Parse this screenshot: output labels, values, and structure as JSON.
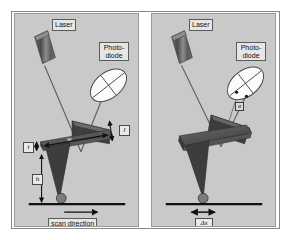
{
  "figure": {
    "caption_absent": true,
    "panels": [
      {
        "id": "left",
        "name": "undeflected-cantilever",
        "labels": {
          "laser": "Laser",
          "photodiode_line1": "Photo-",
          "photodiode_line2": "diode",
          "thickness": "t",
          "width": "w",
          "length": "l",
          "height": "h",
          "scan_direction": "scan direction"
        }
      },
      {
        "id": "right",
        "name": "deflected-cantilever",
        "labels": {
          "laser": "Laser",
          "photodiode_line1": "Photo-",
          "photodiode_line2": "diode",
          "beam_shift_angle": "α",
          "lateral_displacement": "Δs"
        }
      }
    ],
    "colors": {
      "panel_background": "#c9c9c9",
      "frame_border": "#8a8a8a",
      "cantilever_top": "#7a7a7a",
      "cantilever_dark": "#4a4a4a",
      "tip_dark": "#3f3f3f",
      "laser_body": "#5e5e5e",
      "photodiode_face": "#fdfdfd",
      "beam_line": "#6b6b6b",
      "surface_line": "#141414",
      "label_fill": "#e6e6e6"
    }
  }
}
